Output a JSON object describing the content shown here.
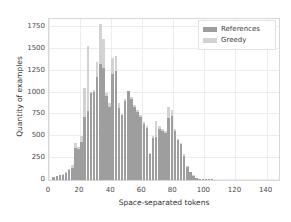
{
  "chart_data": {
    "type": "bar",
    "title": "",
    "xlabel": "Space-separated tokens",
    "ylabel": "Quantity of examples",
    "xlim": [
      0,
      148
    ],
    "ylim": [
      0,
      1840
    ],
    "xticks": [
      0,
      20,
      40,
      60,
      80,
      100,
      120,
      140
    ],
    "yticks": [
      0,
      250,
      500,
      750,
      1000,
      1250,
      1500,
      1750
    ],
    "grid": true,
    "legend_position": "upper right",
    "bin_width": 2,
    "colors": {
      "references": "#9e9e9e",
      "greedy": "#d2d2d2",
      "grid": "#ededed",
      "axis": "#d8d8d8",
      "text": "#3b3b3b",
      "background": "#ffffff"
    },
    "x": [
      3,
      5,
      7,
      9,
      11,
      13,
      15,
      17,
      19,
      21,
      23,
      25,
      27,
      29,
      31,
      33,
      35,
      37,
      39,
      41,
      43,
      45,
      47,
      49,
      51,
      53,
      55,
      57,
      59,
      61,
      63,
      65,
      67,
      69,
      71,
      73,
      75,
      77,
      79,
      81,
      83,
      85,
      87,
      89,
      91,
      93,
      95,
      97,
      99,
      101,
      103,
      105
    ],
    "series": [
      {
        "name": "References",
        "values": [
          30,
          45,
          55,
          60,
          75,
          110,
          140,
          370,
          350,
          430,
          720,
          790,
          1000,
          1010,
          1180,
          1330,
          1280,
          960,
          840,
          1210,
          1250,
          820,
          740,
          900,
          1020,
          930,
          840,
          780,
          720,
          640,
          600,
          300,
          480,
          490,
          580,
          560,
          540,
          710,
          730,
          560,
          460,
          410,
          280,
          150,
          90,
          50,
          25,
          12,
          6,
          3,
          1,
          1
        ]
      },
      {
        "name": "Greedy",
        "values": [
          35,
          50,
          62,
          70,
          95,
          130,
          170,
          420,
          375,
          500,
          1050,
          1530,
          1010,
          1030,
          1350,
          1780,
          1610,
          990,
          880,
          1390,
          1420,
          880,
          760,
          930,
          1010,
          950,
          860,
          800,
          745,
          660,
          620,
          310,
          500,
          670,
          620,
          580,
          560,
          840,
          800,
          580,
          470,
          420,
          300,
          160,
          95,
          55,
          28,
          14,
          7,
          3,
          1,
          1
        ]
      }
    ]
  },
  "legend": {
    "items": [
      {
        "label": "References",
        "color": "#9e9e9e"
      },
      {
        "label": "Greedy",
        "color": "#d2d2d2"
      }
    ]
  }
}
